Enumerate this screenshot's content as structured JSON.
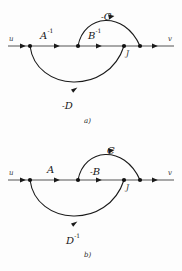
{
  "figure": {
    "panels": [
      {
        "id": "a",
        "caption": "a)",
        "baseline": {
          "start_label": "u",
          "end_label": "v"
        },
        "node_labels": [
          {
            "text": "J"
          }
        ],
        "arc_labels": [
          {
            "text": "A",
            "sup": "-1",
            "prefix": "",
            "position": "baseline-left"
          },
          {
            "text": "B",
            "sup": "-1",
            "prefix": "",
            "position": "baseline-center"
          },
          {
            "text": "C",
            "sup": "",
            "prefix": "-",
            "position": "upper-arc"
          },
          {
            "text": "D",
            "sup": "",
            "prefix": "-",
            "position": "lower-arc"
          }
        ]
      },
      {
        "id": "b",
        "caption": "b)",
        "baseline": {
          "start_label": "u",
          "end_label": "v"
        },
        "node_labels": [
          {
            "text": "J"
          }
        ],
        "arc_labels": [
          {
            "text": "A",
            "sup": "",
            "prefix": "",
            "position": "baseline-left"
          },
          {
            "text": "B",
            "sup": "",
            "prefix": "-",
            "position": "baseline-center"
          },
          {
            "text": "C",
            "sup": "",
            "prefix": "",
            "position": "upper-arc"
          },
          {
            "text": "D",
            "sup": "-1",
            "prefix": "",
            "position": "lower-arc"
          }
        ]
      }
    ],
    "colors": {
      "ink": "#1a1a1a",
      "line": "#3a3a3a",
      "background": "#fdfdfd"
    }
  }
}
